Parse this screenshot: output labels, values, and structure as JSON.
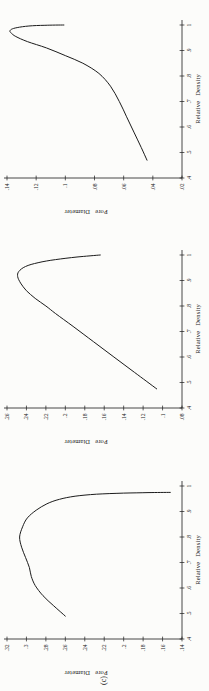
{
  "figure": {
    "label": "(c)",
    "orientation": "charts rotated 90 degrees counterclockwise on page",
    "ink_color": "#1b1b1b",
    "background_color": "#fcfcfa"
  },
  "chart_data": [
    {
      "type": "line",
      "title": "",
      "xlabel": "Relative Density",
      "ylabel": "Pore Diameter",
      "x_ticks": [
        ".4",
        ".5",
        ".6",
        ".7",
        ".8",
        ".9",
        "1"
      ],
      "y_ticks": [
        ".02",
        ".04",
        ".06",
        ".08",
        ".1",
        ".12",
        ".14"
      ],
      "x_range": [
        0.4,
        1.0
      ],
      "y_range": [
        0.02,
        0.14
      ],
      "grid": false,
      "legend": "none",
      "points": [
        [
          0.47,
          0.044
        ],
        [
          0.52,
          0.048
        ],
        [
          0.58,
          0.053
        ],
        [
          0.64,
          0.058
        ],
        [
          0.7,
          0.063
        ],
        [
          0.76,
          0.069
        ],
        [
          0.81,
          0.077
        ],
        [
          0.85,
          0.088
        ],
        [
          0.88,
          0.1
        ],
        [
          0.91,
          0.113
        ],
        [
          0.935,
          0.126
        ],
        [
          0.955,
          0.134
        ],
        [
          0.968,
          0.137
        ],
        [
          0.975,
          0.138
        ],
        [
          0.983,
          0.137
        ],
        [
          0.99,
          0.133
        ],
        [
          0.996,
          0.125
        ],
        [
          0.999,
          0.114
        ],
        [
          1.0,
          0.101
        ]
      ]
    },
    {
      "type": "line",
      "title": "",
      "xlabel": "Relative Density",
      "ylabel": "Pore Diameter",
      "x_ticks": [
        ".4",
        ".5",
        ".6",
        ".7",
        ".8",
        ".9",
        "1"
      ],
      "y_ticks": [
        ".08",
        ".1",
        ".12",
        ".14",
        ".16",
        ".18",
        ".2",
        ".22",
        ".24",
        ".26"
      ],
      "x_range": [
        0.4,
        1.0
      ],
      "y_range": [
        0.08,
        0.26
      ],
      "grid": false,
      "legend": "none",
      "points": [
        [
          0.475,
          0.106
        ],
        [
          0.54,
          0.129
        ],
        [
          0.6,
          0.15
        ],
        [
          0.66,
          0.171
        ],
        [
          0.72,
          0.192
        ],
        [
          0.77,
          0.21
        ],
        [
          0.8,
          0.22
        ],
        [
          0.83,
          0.231
        ],
        [
          0.86,
          0.24
        ],
        [
          0.89,
          0.246
        ],
        [
          0.915,
          0.249
        ],
        [
          0.935,
          0.248
        ],
        [
          0.955,
          0.241
        ],
        [
          0.97,
          0.228
        ],
        [
          0.982,
          0.21
        ],
        [
          0.992,
          0.188
        ],
        [
          1.0,
          0.164
        ]
      ]
    },
    {
      "type": "line",
      "title": "",
      "xlabel": "Relative Density",
      "ylabel": "Pore Diameter",
      "x_ticks": [
        ".4",
        ".5",
        ".6",
        ".7",
        ".8",
        ".9",
        "1"
      ],
      "y_ticks": [
        ".14",
        ".16",
        ".18",
        ".2",
        ".22",
        ".24",
        ".26",
        ".28",
        ".3",
        ".32"
      ],
      "x_range": [
        0.4,
        1.0
      ],
      "y_range": [
        0.14,
        0.32
      ],
      "grid": false,
      "legend": "none",
      "points": [
        [
          0.49,
          0.26
        ],
        [
          0.53,
          0.272
        ],
        [
          0.57,
          0.283
        ],
        [
          0.61,
          0.291
        ],
        [
          0.645,
          0.295
        ],
        [
          0.68,
          0.297
        ],
        [
          0.72,
          0.301
        ],
        [
          0.76,
          0.305
        ],
        [
          0.8,
          0.307
        ],
        [
          0.84,
          0.304
        ],
        [
          0.875,
          0.299
        ],
        [
          0.905,
          0.29
        ],
        [
          0.93,
          0.279
        ],
        [
          0.948,
          0.266
        ],
        [
          0.96,
          0.25
        ],
        [
          0.968,
          0.228
        ],
        [
          0.972,
          0.2
        ],
        [
          0.974,
          0.175
        ],
        [
          0.975,
          0.152
        ]
      ]
    }
  ]
}
